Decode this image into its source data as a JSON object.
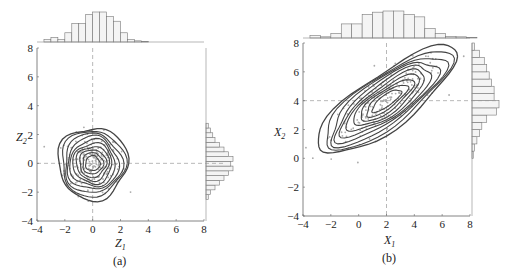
{
  "chart_data": [
    {
      "type": "scatter",
      "subtype": "joint-kde-contour-with-marginal-histograms",
      "panel_label": "(a)",
      "xlabel": "Z1",
      "ylabel": "Z2",
      "xlim": [
        -4,
        8
      ],
      "ylim": [
        -4,
        8
      ],
      "xticks": [
        -4,
        -2,
        0,
        2,
        4,
        6,
        8
      ],
      "yticks": [
        -4,
        -2,
        0,
        2,
        4,
        6,
        8
      ],
      "reference_lines": {
        "x": 0,
        "y": 0,
        "style": "dashed"
      },
      "kde_center": [
        0,
        0
      ],
      "kde_std": [
        1.0,
        1.0
      ],
      "correlation": 0,
      "contour_levels": 10,
      "marginal_x_hist": {
        "bin_start": -3.5,
        "bin_width": 0.5,
        "counts": [
          1,
          2,
          1,
          4,
          8,
          8,
          12,
          13,
          13,
          11,
          9,
          4,
          1,
          0.5,
          0.3
        ]
      },
      "marginal_y_hist": {
        "bin_start": -2.5,
        "bin_width": 0.33,
        "counts": [
          1,
          2,
          4,
          6,
          8,
          10,
          12,
          11,
          12,
          10,
          8,
          6,
          4,
          3,
          2,
          1
        ]
      }
    },
    {
      "type": "scatter",
      "subtype": "joint-kde-contour-with-marginal-histograms",
      "panel_label": "(b)",
      "xlabel": "X1",
      "ylabel": "X2",
      "xlim": [
        -4,
        8
      ],
      "ylim": [
        -4,
        8
      ],
      "xticks": [
        -4,
        -2,
        0,
        2,
        4,
        6,
        8
      ],
      "yticks": [
        -4,
        -2,
        0,
        2,
        4,
        6,
        8
      ],
      "reference_lines": {
        "x": 2,
        "y": 4,
        "style": "dashed"
      },
      "kde_center": [
        2,
        4
      ],
      "kde_std": [
        2.0,
        1.5
      ],
      "correlation": 0.8,
      "contour_levels": 10,
      "marginal_x_hist": {
        "bin_start": -3.5,
        "bin_width": 0.75,
        "counts": [
          1,
          0.5,
          2,
          6,
          6,
          10,
          11,
          11.5,
          11.5,
          10,
          9,
          4,
          2,
          0.7,
          0.5,
          0.3
        ]
      },
      "marginal_y_hist": {
        "bin_start": 0,
        "bin_width": 0.5,
        "counts": [
          0.5,
          1,
          2,
          3,
          4,
          6,
          10,
          11,
          9,
          9,
          8,
          7,
          6,
          5,
          3,
          1
        ]
      }
    }
  ],
  "panels": {
    "a": {
      "caption": "(a)",
      "xlabel_main": "Z",
      "xlabel_sub": "1",
      "ylabel_main": "Z",
      "ylabel_sub": "2"
    },
    "b": {
      "caption": "(b)",
      "xlabel_main": "X",
      "xlabel_sub": "1",
      "ylabel_main": "X",
      "ylabel_sub": "2"
    }
  },
  "tick_labels": [
    "−4",
    "−2",
    "0",
    "2",
    "4",
    "6",
    "8"
  ]
}
